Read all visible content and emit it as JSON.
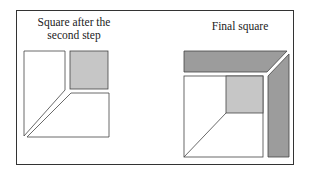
{
  "left_panel": {
    "caption_line1": "Square after the",
    "caption_line2": "second step"
  },
  "right_panel": {
    "caption": "Final square"
  },
  "colors": {
    "dark_gray": "#9c9c9c",
    "light_gray": "#c6c6c6",
    "outline": "#444444"
  }
}
